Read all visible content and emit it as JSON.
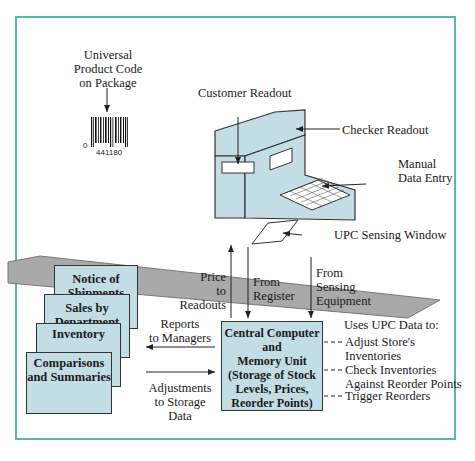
{
  "diagram": {
    "labels": {
      "upc": [
        "Universal",
        "Product Code",
        "on Package"
      ],
      "barcode_left_digit": "0",
      "barcode_digits": "441180",
      "customer_readout": "Customer Readout",
      "checker_readout": "Checker Readout",
      "manual_entry": [
        "Manual",
        "Data Entry"
      ],
      "sensing_window": "UPC Sensing Window",
      "price_to_readouts": [
        "Price",
        "to",
        "Readouts"
      ],
      "from_register": [
        "From",
        "Register"
      ],
      "from_sensing": [
        "From",
        "Sensing",
        "Equipment"
      ],
      "reports_to_managers": [
        "Reports",
        "to Managers"
      ],
      "adjustments": [
        "Adjustments",
        "to Storage",
        "Data"
      ],
      "uses_upc": "Uses UPC Data to:",
      "uses": [
        [
          "Adjust Store's",
          "Inventories"
        ],
        [
          "Check Inventories",
          "Against Reorder Points"
        ],
        [
          "Trigger Reorders"
        ]
      ]
    },
    "central": [
      "Central Computer",
      "and",
      "Memory Unit",
      "(Storage of Stock",
      "Levels, Prices,",
      "Reorder Points)"
    ],
    "reports": [
      [
        "Notice of",
        "Shipments"
      ],
      [
        "Sales by",
        "Department"
      ],
      [
        "Inventory"
      ],
      [
        "Comparisons",
        "and Summaries"
      ]
    ],
    "colors": {
      "frame": "#5fb3b0",
      "box_fill": "#c3dde4",
      "belt": "#a9a9a9"
    }
  }
}
